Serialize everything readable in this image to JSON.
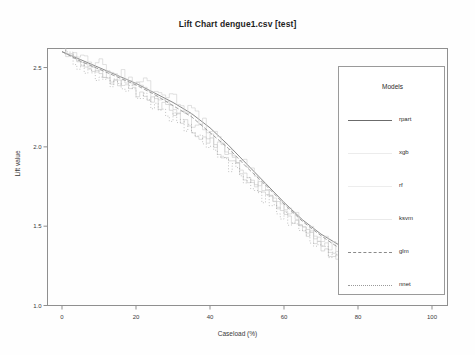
{
  "title": "Lift Chart  dengue1.csv [test]",
  "axes": {
    "xlabel": "Caseload (%)",
    "ylabel": "Lift value",
    "xticks": [
      "0",
      "20",
      "40",
      "60",
      "80",
      "100"
    ],
    "yticks": [
      "2.5",
      "2.0",
      "1.5",
      "1.0"
    ]
  },
  "legend": {
    "title": "Models",
    "entries": [
      {
        "label": "rpart",
        "style": "solid",
        "color": "#6b6b6b"
      },
      {
        "label": "xgb",
        "style": "faint",
        "color": "#c9c9c9"
      },
      {
        "label": "rf",
        "style": "faint",
        "color": "#cccccc"
      },
      {
        "label": "ksvm",
        "style": "faint",
        "color": "#c4c4c4"
      },
      {
        "label": "glm",
        "style": "dashed",
        "color": "#8a8a8a"
      },
      {
        "label": "nnet",
        "style": "dotted",
        "color": "#9a9a9a"
      }
    ]
  },
  "chart_data": {
    "type": "line",
    "title": "Lift Chart  dengue1.csv [test]",
    "xlabel": "Caseload (%)",
    "ylabel": "Lift value",
    "xlim": [
      0,
      100
    ],
    "ylim": [
      1.0,
      2.62
    ],
    "grid": false,
    "legend_position": "right",
    "series": [
      {
        "name": "rpart",
        "x": [
          0,
          5,
          10,
          15,
          20,
          25,
          30,
          35,
          40,
          45,
          50,
          55,
          60,
          65,
          70,
          75
        ],
        "values": [
          2.6,
          2.55,
          2.5,
          2.45,
          2.4,
          2.34,
          2.28,
          2.21,
          2.12,
          2.01,
          1.89,
          1.77,
          1.65,
          1.54,
          1.45,
          1.38
        ]
      },
      {
        "name": "xgb",
        "x": [
          0,
          5,
          10,
          15,
          20,
          25,
          30,
          35,
          40,
          45,
          50,
          55,
          60,
          65,
          70,
          75
        ],
        "values": [
          2.6,
          2.53,
          2.47,
          2.42,
          2.38,
          2.3,
          2.24,
          2.16,
          2.05,
          1.95,
          1.83,
          1.71,
          1.6,
          1.49,
          1.4,
          1.31
        ]
      },
      {
        "name": "rf",
        "x": [
          0,
          5,
          10,
          15,
          20,
          25,
          30,
          35,
          40,
          45,
          50,
          55,
          60,
          65,
          70,
          75
        ],
        "values": [
          2.6,
          2.56,
          2.52,
          2.47,
          2.43,
          2.36,
          2.3,
          2.22,
          2.1,
          1.98,
          1.86,
          1.74,
          1.62,
          1.51,
          1.42,
          1.34
        ]
      },
      {
        "name": "ksvm",
        "x": [
          0,
          5,
          10,
          15,
          20,
          25,
          30,
          35,
          40,
          45,
          50,
          55,
          60,
          65,
          70,
          75
        ],
        "values": [
          2.6,
          2.52,
          2.46,
          2.41,
          2.35,
          2.28,
          2.2,
          2.12,
          2.02,
          1.91,
          1.8,
          1.68,
          1.57,
          1.47,
          1.38,
          1.29
        ]
      },
      {
        "name": "glm",
        "x": [
          0,
          5,
          10,
          15,
          20,
          25,
          30,
          35,
          40,
          45,
          50,
          55,
          60,
          65,
          70,
          75
        ],
        "values": [
          2.6,
          2.54,
          2.49,
          2.44,
          2.39,
          2.33,
          2.26,
          2.19,
          2.09,
          1.99,
          1.87,
          1.76,
          1.64,
          1.53,
          1.44,
          1.36
        ]
      },
      {
        "name": "nnet",
        "x": [
          0,
          5,
          10,
          15,
          20,
          25,
          30,
          35,
          40,
          45,
          50,
          55,
          60,
          65,
          70,
          75
        ],
        "values": [
          2.6,
          2.5,
          2.44,
          2.4,
          2.33,
          2.26,
          2.18,
          2.09,
          1.99,
          1.88,
          1.77,
          1.66,
          1.55,
          1.45,
          1.36,
          1.27
        ]
      }
    ]
  }
}
